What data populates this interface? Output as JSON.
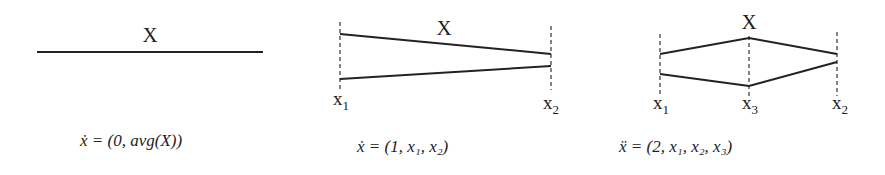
{
  "panels": [
    {
      "id": "constant",
      "top_label": "X",
      "formula": "ẋ = (0, avg(X))",
      "geometry": {
        "line": {
          "x1": 37,
          "y1": 52,
          "x2": 263,
          "y2": 52
        },
        "label_pos": {
          "x": 150,
          "y": 42
        }
      }
    },
    {
      "id": "linear",
      "top_label": "X",
      "axis_labels": [
        {
          "base": "x",
          "sub": "1"
        },
        {
          "base": "x",
          "sub": "2"
        }
      ],
      "formula": "ẋ = (1, x₁, x₂)",
      "geometry": {
        "dashed": [
          340,
          551
        ],
        "upper": [
          [
            340,
            34
          ],
          [
            551,
            54
          ]
        ],
        "lower": [
          [
            340,
            79
          ],
          [
            551,
            66
          ]
        ]
      }
    },
    {
      "id": "piecewise",
      "top_label": "X",
      "axis_labels": [
        {
          "base": "x",
          "sub": "1"
        },
        {
          "base": "x",
          "sub": "3"
        },
        {
          "base": "x",
          "sub": "2"
        }
      ],
      "formula": "ẍ = (2, x₁, x₂, x₃)",
      "geometry": {
        "dashed": [
          660,
          749,
          837
        ],
        "upper": [
          [
            660,
            54
          ],
          [
            749,
            38
          ],
          [
            837,
            54
          ]
        ],
        "lower": [
          [
            660,
            74
          ],
          [
            749,
            86
          ],
          [
            837,
            62
          ]
        ]
      }
    }
  ],
  "colors": {
    "stroke": "#222222",
    "background": "#ffffff"
  }
}
